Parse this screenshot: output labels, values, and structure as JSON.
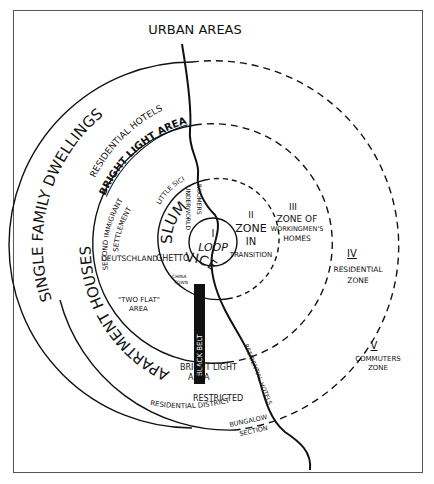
{
  "title": "URBAN AREAS",
  "zones": [
    {
      "numeral": "I",
      "name": "LOOP"
    },
    {
      "numeral": "II",
      "name_lines": [
        "ZONE",
        "IN",
        "TRANSITION"
      ]
    },
    {
      "numeral": "III",
      "name_lines": [
        "ZONE OF",
        "WORKINGMEN'S",
        "HOMES"
      ]
    },
    {
      "numeral": "IV",
      "name_lines": [
        "RESIDENTIAL",
        "ZONE"
      ]
    },
    {
      "numeral": "V",
      "name_lines": [
        "COMMUTERS",
        "ZONE"
      ]
    }
  ],
  "arc_labels": {
    "single_family": "SINGLE FAMILY DWELLINGS",
    "residential_hotels": "RESIDENTIAL HOTELS",
    "bright_light_top": "BRIGHT LIGHT AREA",
    "apartment_houses": "APARTMENT HOUSES",
    "slum": "SLUM",
    "vice": "VICE",
    "little_sicily": "LITTLE SICILY",
    "second_immigrant": "SECOND IMMIGRANT",
    "settlement": "SETTLEMENT"
  },
  "vertical_labels": {
    "underworld": "UNDERWORLD",
    "roomers": "ROOMERS",
    "black_belt": "BLACK BELT",
    "residential_hotels_river": "RESIDENTIAL HOTELS"
  },
  "place_labels": {
    "deutschland": "DEUTSCHLAND",
    "ghetto": "GHETTO",
    "china_town_1": "CHINA",
    "china_town_2": "TOWN",
    "two_flat_1": "\"TWO FLAT\"",
    "two_flat_2": "AREA",
    "bright_light_bottom_1": "BRIGHT LIGHT",
    "bright_light_bottom_2": "AREA",
    "restricted_1": "RESTRICTED",
    "restricted_2": "RESIDENTIAL DISTRICT",
    "bungalow_1": "BUNGALOW",
    "bungalow_2": "SECTION"
  },
  "colors": {
    "ink": "#111111",
    "background": "#ffffff",
    "frame": "#555555"
  }
}
